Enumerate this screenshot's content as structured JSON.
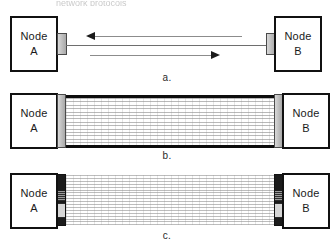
{
  "figure": {
    "top_caption_remnant": "network protocols",
    "width": 334,
    "height": 250,
    "background_color": "#ffffff",
    "line_color": "#8c8c8c",
    "rail_color": "#0d0d0d",
    "node_border_color": "#111111",
    "connector_light_color": "#bdbdbd",
    "connector_dark_color": "#1b1b1b"
  },
  "panels": [
    {
      "id": "a",
      "caption": "a.",
      "description": "single packet in flight in each direction",
      "left_node": {
        "line1": "Node",
        "line2": "A"
      },
      "right_node": {
        "line1": "Node",
        "line2": "B"
      },
      "links": [
        {
          "direction": "left",
          "arrow": "arrow-left-icon",
          "label": ""
        },
        {
          "direction": "none",
          "arrow": "",
          "label": ""
        },
        {
          "direction": "right",
          "arrow": "arrow-right-icon",
          "label": ""
        }
      ],
      "connector_style": "light-tab",
      "packet_lines": 0
    },
    {
      "id": "b",
      "caption": "b.",
      "description": "many packets filling the pipe between the nodes",
      "left_node": {
        "line1": "Node",
        "line2": "A"
      },
      "right_node": {
        "line1": "Node",
        "line2": "B"
      },
      "links": [],
      "connector_style": "light-tab",
      "packet_lines": 18,
      "has_rails": true
    },
    {
      "id": "c",
      "caption": "c.",
      "description": "high bandwidth-delay product link, dark multi-pin connectors",
      "left_node": {
        "line1": "Node",
        "line2": "A"
      },
      "right_node": {
        "line1": "Node",
        "line2": "B"
      },
      "links": [],
      "connector_style": "dark-connector",
      "packet_lines": 22,
      "has_rails": false
    }
  ]
}
